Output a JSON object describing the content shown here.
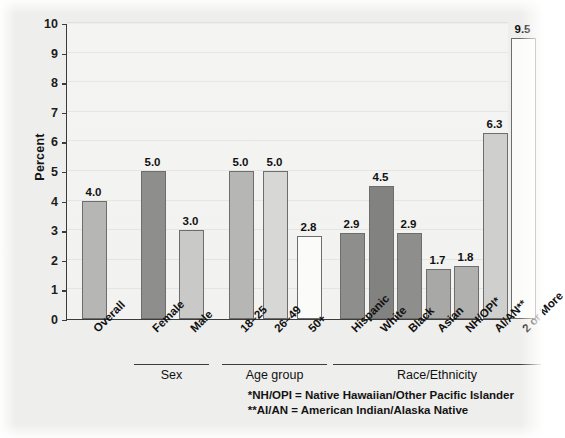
{
  "chart_data": {
    "type": "bar",
    "title": "",
    "subtitle": "",
    "xlabel": "",
    "ylabel": "Percent",
    "ylim": [
      0,
      10
    ],
    "ytick_step": 1,
    "yticks": [
      "0",
      "1",
      "2",
      "3",
      "4",
      "5",
      "6",
      "7",
      "8",
      "9",
      "10"
    ],
    "grid": true,
    "legend": "none",
    "categories": [
      "Overall",
      "Female",
      "Male",
      "18–25",
      "26–49",
      "50+",
      "Hispanic",
      "White",
      "Black",
      "Asian",
      "NH/OPI*",
      "AI/AN**",
      "2 or More"
    ],
    "values": [
      4.0,
      5.0,
      3.0,
      5.0,
      5.0,
      2.8,
      2.9,
      4.5,
      2.9,
      1.7,
      1.8,
      6.3,
      9.5
    ],
    "value_labels": [
      "4.0",
      "5.0",
      "3.0",
      "5.0",
      "5.0",
      "2.8",
      "2.9",
      "4.5",
      "2.9",
      "1.7",
      "1.8",
      "6.3",
      "9.5"
    ],
    "bar_colors": [
      "#b6b6b4",
      "#8e8e8c",
      "#c9c9c7",
      "#b6b6b4",
      "#d7d7d5",
      "#fbfbf9",
      "#8e8e8c",
      "#828280",
      "#8e8e8c",
      "#a8a8a6",
      "#b0b0ae",
      "#cfcfcd",
      "#fbfbf9"
    ],
    "groups": [
      {
        "label": "Sex",
        "start_index": 1,
        "end_index": 2
      },
      {
        "label": "Age group",
        "start_index": 3,
        "end_index": 5
      },
      {
        "label": "Race/Ethnicity",
        "start_index": 6,
        "end_index": 12
      }
    ],
    "annotations": [
      "*NH/OPI = Native Hawaiian/Other Pacific Islander",
      "**AI/AN = American Indian/Alaska Native"
    ]
  },
  "footnotes": {
    "line1": "*NH/OPI = Native Hawaiian/Other Pacific Islander",
    "line2": "**AI/AN = American Indian/Alaska Native"
  },
  "colors": {
    "background": "#eeeeec",
    "plot_background": "#f3f3f1",
    "axis": "#3b3b3b",
    "text": "#111111"
  }
}
